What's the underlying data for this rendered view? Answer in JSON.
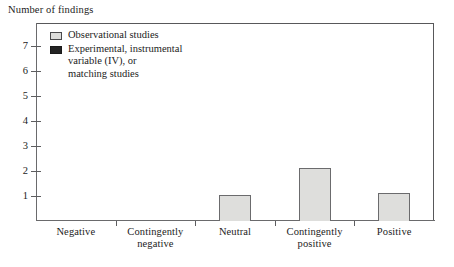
{
  "chart_data": {
    "type": "bar",
    "title": "",
    "ylabel": "Number of findings",
    "xlabel": "",
    "ylim": [
      0,
      7.9
    ],
    "yticks": [
      7,
      6,
      5,
      4,
      3,
      2,
      1
    ],
    "grid": false,
    "legend_position": "top-left",
    "categories": [
      "Negative",
      "Contingently\nnegative",
      "Neutral",
      "Contingently\npositive",
      "Positive"
    ],
    "series": [
      {
        "name": "Observational studies",
        "color": "#dededc",
        "values": [
          0,
          0,
          1.05,
          2.1,
          1.1
        ]
      },
      {
        "name": "Experimental, instrumental\nvariable (IV), or\nmatching studies",
        "color": "#2b2b2b",
        "values": [
          0,
          0,
          0,
          0,
          0
        ]
      }
    ]
  },
  "legend": {
    "items": [
      {
        "label": "Observational studies",
        "swatch": "light-gray"
      },
      {
        "label": "Experimental, instrumental\nvariable (IV), or\nmatching studies",
        "swatch": "dark"
      }
    ]
  },
  "axis": {
    "y_title": "Number of findings",
    "y_tick_labels": [
      "7",
      "6",
      "5",
      "4",
      "3",
      "2",
      "1"
    ],
    "x_tick_labels": [
      "Negative",
      "Contingently\nnegative",
      "Neutral",
      "Contingently\npositive",
      "Positive"
    ]
  }
}
